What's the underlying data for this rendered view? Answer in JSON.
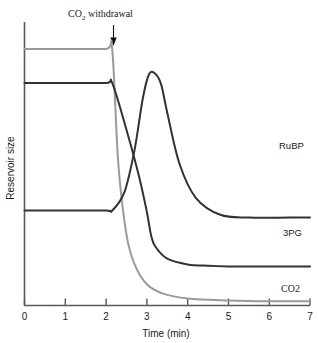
{
  "chart_data": {
    "type": "line",
    "title": "",
    "xlabel": "Time (min)",
    "ylabel": "Reservoir size",
    "xlim": [
      0,
      7
    ],
    "ylim": [
      0,
      1
    ],
    "xticks": [
      "0",
      "1",
      "2",
      "3",
      "4",
      "5",
      "6",
      "7"
    ],
    "yticks": [],
    "grid": false,
    "legend_position": "right-inline",
    "annotations": [
      {
        "name": "co2-withdrawal",
        "text": "CO",
        "subscript": "2",
        "text_tail": " withdrawal",
        "full_text": "CO2 withdrawal",
        "at_x": 2.15,
        "marker": "down-arrow"
      }
    ],
    "series": [
      {
        "name": "CO2",
        "label": "CO2",
        "color": "#9a9a9a",
        "description": "Highest plateau before withdrawal; drops sharply to near zero at t=2.15 and stays near baseline.",
        "x": [
          0,
          1.0,
          2.0,
          2.15,
          2.3,
          2.5,
          2.7,
          3.0,
          3.4,
          4.0,
          5.0,
          6.0,
          7.0
        ],
        "y": [
          0.905,
          0.905,
          0.905,
          0.905,
          0.5,
          0.25,
          0.145,
          0.075,
          0.042,
          0.025,
          0.018,
          0.015,
          0.015
        ]
      },
      {
        "name": "RuBP",
        "label": "RuBP",
        "color": "#2f3336",
        "description": "Mid-high plateau before withdrawal; falls steeply through the crossing point to a trough just past t=3, then settles.",
        "x": [
          0,
          1.0,
          2.0,
          2.15,
          2.5,
          2.8,
          3.0,
          3.1,
          3.2,
          3.5,
          4.0,
          4.5,
          5.0,
          6.0,
          7.0
        ],
        "y": [
          0.785,
          0.785,
          0.785,
          0.785,
          0.62,
          0.46,
          0.33,
          0.25,
          0.21,
          0.165,
          0.145,
          0.14,
          0.138,
          0.138,
          0.138
        ]
      },
      {
        "name": "3PG",
        "label": "3PG",
        "color": "#2f3336",
        "description": "Low plateau before withdrawal; spikes to a rounded peak near t=3.2 then decays to an intermediate steady level.",
        "x": [
          0,
          1.0,
          2.0,
          2.15,
          2.45,
          2.7,
          2.9,
          3.05,
          3.2,
          3.35,
          3.5,
          3.8,
          4.2,
          4.8,
          5.5,
          6.5,
          7.0
        ],
        "y": [
          0.335,
          0.335,
          0.335,
          0.335,
          0.4,
          0.55,
          0.73,
          0.815,
          0.818,
          0.78,
          0.68,
          0.5,
          0.38,
          0.32,
          0.31,
          0.31,
          0.31
        ]
      }
    ]
  },
  "axis": {
    "x_title": "Time (min)",
    "y_title": "Reservoir size"
  },
  "labels": {
    "rubp": "RuBP",
    "pg3": "3PG",
    "co2": "CO2"
  },
  "annotation": {
    "co2_prefix": "CO",
    "co2_sub": "2",
    "co2_suffix": " withdrawal"
  },
  "colors": {
    "co2_line": "#9a9a9a",
    "dark_line": "#2f3336",
    "axis": "#555a5e",
    "text": "#1a1a1a",
    "background": "#ffffff"
  }
}
